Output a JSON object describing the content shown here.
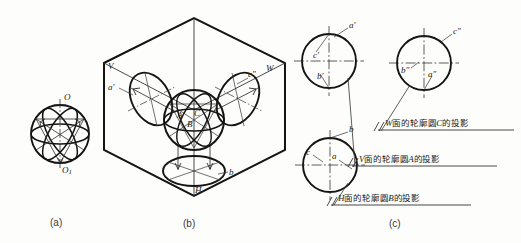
{
  "figure": {
    "title_captions": [
      {
        "id": "cap-a",
        "text": "(a)"
      },
      {
        "id": "cap-b",
        "text": "(b)"
      },
      {
        "id": "cap-c",
        "text": "(c)"
      }
    ]
  },
  "panel_a": {
    "caption": "(a)",
    "labels": {
      "top_pole": "O",
      "bottom_pole": "O",
      "bottom_pole_sub": "1"
    }
  },
  "panel_b": {
    "caption": "(b)",
    "labels": {
      "plane_v": "V",
      "plane_w": "W",
      "plane_h": "H",
      "ellipse_v": "a′",
      "ellipse_w": "c″",
      "ellipse_h": "b",
      "circle_a": "A",
      "circle_b": "B",
      "circle_c": "C"
    }
  },
  "panel_c": {
    "caption": "(c)",
    "front_view": {
      "name": "front-view-circle",
      "labels": {
        "a": "a′",
        "c": "c′",
        "b": "b′"
      }
    },
    "side_view": {
      "name": "side-view-circle",
      "labels": {
        "c": "c″",
        "b": "b″",
        "a": "a″"
      }
    },
    "top_view": {
      "name": "top-view-circle",
      "labels": {
        "b": "b",
        "c": "c",
        "a": "a"
      }
    },
    "annotations": [
      {
        "id": "note-w",
        "prefix": "//",
        "text_before": "面的轮廓圆",
        "plane": "W",
        "circle": "C",
        "text_after": "的投影"
      },
      {
        "id": "note-v",
        "prefix": "//",
        "text_before": "面的轮廓圆",
        "plane": "V",
        "circle": "A",
        "text_after": "的投影"
      },
      {
        "id": "note-h",
        "prefix": "//",
        "text_before": "面的轮廓圆",
        "plane": "H",
        "circle": "B",
        "text_after": "的投影"
      }
    ]
  },
  "colors": {
    "ink": "#1a1a1a",
    "thin": "#444444",
    "paper": "#fdfdfb"
  }
}
